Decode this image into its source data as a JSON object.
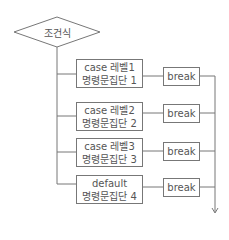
{
  "diagram": {
    "type": "switch-case flowchart",
    "condition": {
      "label": "조건식",
      "shape": "diamond"
    },
    "cases": [
      {
        "line1": "case 레벨1",
        "line2": "명령문집단 1",
        "break_label": "break"
      },
      {
        "line1": "case 레벨2",
        "line2": "명령문집단 2",
        "break_label": "break"
      },
      {
        "line1": "case 레벨3",
        "line2": "명령문집단 3",
        "break_label": "break"
      },
      {
        "line1": "default",
        "line2": "명령문집단 4",
        "break_label": "break"
      }
    ],
    "colors": {
      "line": "#777777",
      "text": "#555555",
      "background": "#ffffff"
    }
  }
}
